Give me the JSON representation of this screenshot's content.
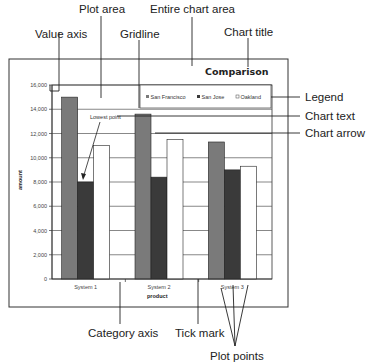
{
  "callouts": {
    "plot_area": "Plot area",
    "entire_chart_area": "Entire chart area",
    "value_axis": "Value axis",
    "gridline": "Gridline",
    "chart_title": "Chart title",
    "legend": "Legend",
    "chart_text": "Chart text",
    "chart_arrow": "Chart arrow",
    "category_axis": "Category axis",
    "tick_mark": "Tick mark",
    "plot_points": "Plot points"
  },
  "annotation": {
    "lowest_point": "Lowest point"
  },
  "colors": {
    "san_francisco": "#7a7a7a",
    "san_jose": "#3a3a3a",
    "oakland": "#ffffff",
    "gridline": "#555555"
  },
  "chart_data": {
    "type": "bar",
    "title": "Comparison",
    "xlabel": "product",
    "ylabel": "amount",
    "categories": [
      "System 1",
      "System 2",
      "System 3"
    ],
    "series": [
      {
        "name": "San Francisco",
        "values": [
          15000,
          13600,
          11300
        ]
      },
      {
        "name": "San Jose",
        "values": [
          8000,
          8400,
          9000
        ]
      },
      {
        "name": "Oakland",
        "values": [
          11000,
          11500,
          9300
        ]
      }
    ],
    "yticks": [
      "0",
      "2,000",
      "4,000",
      "6,000",
      "8,000",
      "10,000",
      "12,000",
      "14,000",
      "16,000"
    ],
    "ylim": [
      0,
      16000
    ],
    "grid": true,
    "legend_position": "top-right inside plot"
  }
}
